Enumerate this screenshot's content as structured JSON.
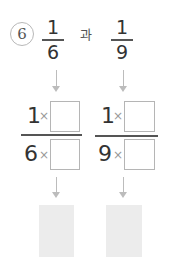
{
  "problem": {
    "number": "6",
    "connector": "과",
    "fractions": [
      {
        "numerator": "1",
        "denominator": "6"
      },
      {
        "numerator": "1",
        "denominator": "9"
      }
    ],
    "expansions": [
      {
        "numerator": "1",
        "denominator": "6",
        "operator": "×"
      },
      {
        "numerator": "1",
        "denominator": "9",
        "operator": "×"
      }
    ],
    "answer_boxes": [
      "",
      ""
    ]
  },
  "colors": {
    "text": "#333333",
    "arrow": "#bcbcbc",
    "box_border": "#b5b5b5",
    "answer_fill": "#ececec"
  }
}
